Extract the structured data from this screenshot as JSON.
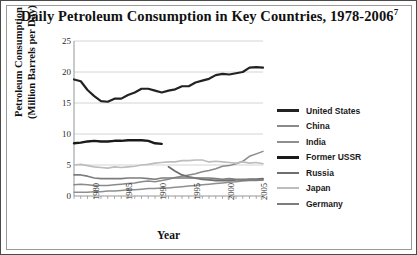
{
  "figure": {
    "title": "Daily Petroleum Consumption in Key Countries, 1978-2006",
    "title_superscript": "7",
    "border_color": "#4a4a4a"
  },
  "axes": {
    "xlabel": "Year",
    "ylabel_line1": "Petroleum Consumption",
    "ylabel_line2": "(Million Barrels per Day)"
  },
  "chart_data": {
    "type": "line",
    "title": "Daily Petroleum Consumption in Key Countries, 1978-2006",
    "xlabel": "Year",
    "ylabel": "Petroleum Consumption (Million Barrels per Day)",
    "xlim": [
      1978,
      2006
    ],
    "ylim": [
      0,
      25
    ],
    "xticks": [
      1980,
      1985,
      1990,
      1995,
      2000,
      2005
    ],
    "yticks": [
      0,
      5,
      10,
      15,
      20,
      25
    ],
    "grid": "horizontal",
    "legend_position": "right",
    "x": [
      1978,
      1979,
      1980,
      1981,
      1982,
      1983,
      1984,
      1985,
      1986,
      1987,
      1988,
      1989,
      1990,
      1991,
      1992,
      1993,
      1994,
      1995,
      1996,
      1997,
      1998,
      1999,
      2000,
      2001,
      2002,
      2003,
      2004,
      2005,
      2006
    ],
    "series": [
      {
        "name": "United States",
        "color": "#222222",
        "width": 2.2,
        "values": [
          18.8,
          18.5,
          17.1,
          16.1,
          15.3,
          15.2,
          15.7,
          15.7,
          16.3,
          16.7,
          17.3,
          17.3,
          17.0,
          16.7,
          17.0,
          17.2,
          17.7,
          17.7,
          18.3,
          18.6,
          18.9,
          19.5,
          19.7,
          19.6,
          19.8,
          20.0,
          20.7,
          20.8,
          20.7
        ],
        "legend_width": 3.4
      },
      {
        "name": "China",
        "color": "#8a8a8a",
        "width": 1.5,
        "values": [
          1.8,
          1.9,
          1.8,
          1.7,
          1.7,
          1.7,
          1.8,
          1.9,
          2.0,
          2.1,
          2.3,
          2.4,
          2.3,
          2.5,
          2.7,
          3.0,
          3.2,
          3.4,
          3.6,
          3.9,
          4.1,
          4.4,
          4.8,
          4.9,
          5.2,
          5.6,
          6.4,
          6.8,
          7.2
        ],
        "legend_width": 2.2
      },
      {
        "name": "India",
        "color": "#8f8f8f",
        "width": 1.5,
        "values": [
          0.6,
          0.6,
          0.6,
          0.7,
          0.7,
          0.8,
          0.8,
          0.9,
          1.0,
          1.0,
          1.1,
          1.2,
          1.2,
          1.3,
          1.3,
          1.4,
          1.5,
          1.6,
          1.7,
          1.8,
          1.9,
          2.0,
          2.1,
          2.2,
          2.3,
          2.4,
          2.5,
          2.5,
          2.6
        ],
        "legend_width": 2.2
      },
      {
        "name": "Former USSR",
        "color": "#1a1a1a",
        "width": 2.4,
        "values": [
          8.5,
          8.6,
          8.8,
          8.9,
          8.8,
          8.8,
          8.9,
          8.9,
          9.0,
          9.0,
          9.0,
          8.9,
          8.5,
          8.4,
          null,
          null,
          null,
          null,
          null,
          null,
          null,
          null,
          null,
          null,
          null,
          null,
          null,
          null,
          null
        ],
        "legend_width": 3.6
      },
      {
        "name": "Russia",
        "color": "#6e6e6e",
        "width": 1.8,
        "values": [
          null,
          null,
          null,
          null,
          null,
          null,
          null,
          null,
          null,
          null,
          null,
          null,
          null,
          null,
          4.7,
          4.0,
          3.4,
          3.1,
          2.9,
          2.7,
          2.6,
          2.5,
          2.5,
          2.5,
          2.6,
          2.6,
          2.7,
          2.7,
          2.8
        ],
        "legend_width": 2.6
      },
      {
        "name": "Japan",
        "color": "#bdbdbd",
        "width": 1.6,
        "values": [
          5.0,
          5.1,
          4.9,
          4.7,
          4.6,
          4.5,
          4.7,
          4.6,
          4.7,
          4.8,
          5.0,
          5.1,
          5.3,
          5.4,
          5.5,
          5.5,
          5.7,
          5.7,
          5.8,
          5.8,
          5.5,
          5.6,
          5.5,
          5.4,
          5.3,
          5.5,
          5.3,
          5.4,
          5.2
        ],
        "legend_width": 2.2
      },
      {
        "name": "Germany",
        "color": "#7c7c7c",
        "width": 1.6,
        "values": [
          3.4,
          3.4,
          3.2,
          2.9,
          2.8,
          2.8,
          2.8,
          2.8,
          2.9,
          2.9,
          2.9,
          2.8,
          2.7,
          2.9,
          2.9,
          2.9,
          2.9,
          2.9,
          2.9,
          2.9,
          2.9,
          2.8,
          2.7,
          2.8,
          2.7,
          2.7,
          2.6,
          2.6,
          2.6
        ],
        "legend_width": 2.2
      }
    ]
  },
  "legend": {
    "items": [
      {
        "label": "United States"
      },
      {
        "label": "China"
      },
      {
        "label": "India"
      },
      {
        "label": "Former USSR"
      },
      {
        "label": "Russia"
      },
      {
        "label": "Japan"
      },
      {
        "label": "Germany"
      }
    ]
  }
}
